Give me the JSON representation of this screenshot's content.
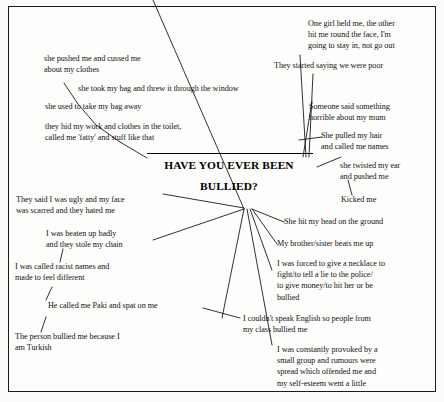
{
  "diagram": {
    "type": "mind-map",
    "title": "HAVE YOU EVER BEEN BULLIED?",
    "center": {
      "line1": "HAVE YOU EVER BEEN",
      "line2": "BULLIED?"
    },
    "colors": {
      "ink": "#131313",
      "border": "#1a1a1a",
      "background": "#fdfdfb"
    },
    "branches": [
      {
        "id": "pushed-cussed",
        "text": "she pushed me and cussed me\nabout my clothes"
      },
      {
        "id": "took-bag-window",
        "text": "she took my bag and threw it through the window"
      },
      {
        "id": "take-bag-away",
        "text": "she used to take my bag away"
      },
      {
        "id": "hid-work-clothes",
        "text": "they hid my work and clothes in the toilet,\ncalled me 'fatty' and stuff like that"
      },
      {
        "id": "one-girl-held-me",
        "text": "One girl held me, the other\nhit me round the face, I'm\ngoing  to stay in, not go out"
      },
      {
        "id": "saying-we-were-poor",
        "text": "They started saying we were poor"
      },
      {
        "id": "horrible-about-mum",
        "text": "Someone said something\nhorrible about my mum"
      },
      {
        "id": "pulled-hair-names",
        "text": "She pulled my hair\nand called me names"
      },
      {
        "id": "twisted-ear",
        "text": "she twisted my ear\nand pushed me"
      },
      {
        "id": "kicked-me",
        "text": "Kicked me"
      },
      {
        "id": "hit-head-ground",
        "text": "She hit my head on the ground"
      },
      {
        "id": "brother-sister",
        "text": "My brother/sister beats me up"
      },
      {
        "id": "forced-necklace",
        "text": "I was forced to give a necklace to\nfight/to tell a lie to the police/\nto give money/to hit her or be\nbullied"
      },
      {
        "id": "couldnt-speak-english",
        "text": "I couldn't speak English so people from\nmy class bullied me"
      },
      {
        "id": "constantly-provoked",
        "text": "I was constantly provoked by a\nsmall group and rumours were\nspread which offended me and\nmy self-esteem went a little"
      },
      {
        "id": "ugly-face-scarred",
        "text": "They said I was ugly and my face\nwas scarred and they hated me"
      },
      {
        "id": "beaten-up-chain",
        "text": "I was beaten up badly\nand they stole my chain"
      },
      {
        "id": "racist-names",
        "text": "I was called racist names and\nmade to feel different"
      },
      {
        "id": "paki-spat",
        "text": "He called me Paki and spat on me"
      },
      {
        "id": "turkish",
        "text": "The person bullied me because I\nam Turkish"
      }
    ]
  }
}
